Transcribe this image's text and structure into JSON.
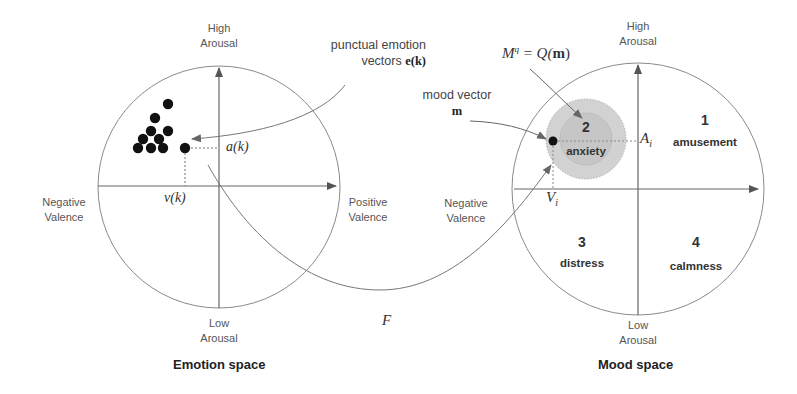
{
  "emotion_space": {
    "caption": "Emotion space",
    "axis_top": [
      "High",
      "Arousal"
    ],
    "axis_bottom": [
      "Low",
      "Arousal"
    ],
    "axis_left": [
      "Negative",
      "Valence"
    ],
    "axis_right": [
      "Positive",
      "Valence"
    ],
    "arousal_symbol": "a(k)",
    "valence_symbol": "v(k)",
    "annotation": {
      "line1": "punctual emotion",
      "line2_prefix": "vectors ",
      "line2_symbol": "e(k)"
    },
    "points_count": 10
  },
  "mood_space": {
    "caption": "Mood space",
    "axis_top": [
      "High",
      "Arousal"
    ],
    "axis_bottom": [
      "Low",
      "Arousal"
    ],
    "axis_left": [
      "Negative",
      "Valence"
    ],
    "arousal_symbol": "A",
    "arousal_subscript": "i",
    "valence_symbol": "V",
    "valence_subscript": "i",
    "mood_vector_label": "mood vector",
    "mood_vector_symbol": "m",
    "quantized_label": "M",
    "quantized_sup": "q",
    "quantized_eq": " = Q(",
    "quantized_arg": "m",
    "quantized_close": ")",
    "quadrants": [
      {
        "number": "1",
        "name": "amusement"
      },
      {
        "number": "2",
        "name": "anxiety"
      },
      {
        "number": "3",
        "name": "distress"
      },
      {
        "number": "4",
        "name": "calmness"
      }
    ]
  },
  "mapping_label": "F",
  "colors": {
    "line": "#7a7a7a",
    "axis": "#555555",
    "point": "#111111",
    "mood_region_fill": "#cfcfcf",
    "mood_region_inner": "#c4c4c4"
  }
}
